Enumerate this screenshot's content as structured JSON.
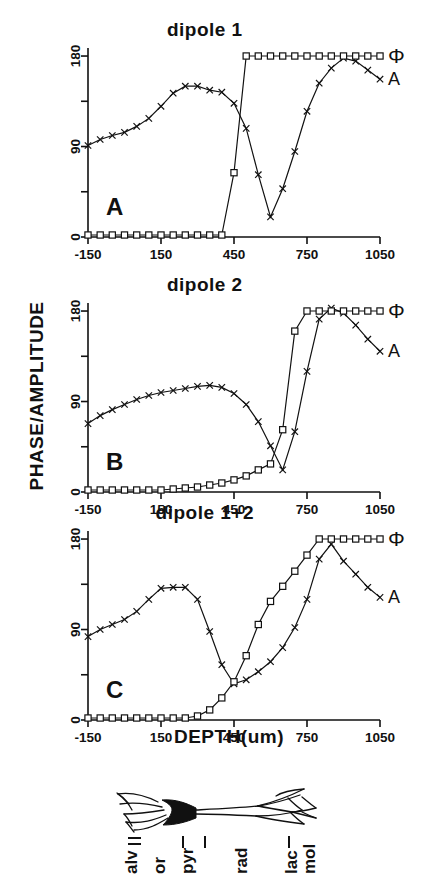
{
  "figure": {
    "y_axis_label": "PHASE/AMPLITUDE",
    "x_axis_label": "DEPTH(um)"
  },
  "axes": {
    "x_ticks": [
      "-150",
      "150",
      "450",
      "750",
      "1050"
    ],
    "x_tick_values": [
      -150,
      150,
      450,
      750,
      1050
    ],
    "y_ticks_labeled": [
      "0",
      "90",
      "180"
    ],
    "y_tick_values_labeled": [
      0,
      90,
      180
    ],
    "y_tick_values_all": [
      0,
      45,
      90,
      135,
      180
    ],
    "xlim": [
      -150,
      1050
    ],
    "ylim": [
      0,
      188
    ]
  },
  "series_labels": {
    "phase": "Φ",
    "amplitude": "A"
  },
  "panels": [
    {
      "letter": "A",
      "title": "dipole 1"
    },
    {
      "letter": "B",
      "title": "dipole 2"
    },
    {
      "letter": "C",
      "title": "dipole 1+2"
    }
  ],
  "morphology": {
    "layers": [
      "alv",
      "or",
      "pyr",
      "rad",
      "lac",
      "mol"
    ]
  },
  "chart_data": [
    {
      "type": "line",
      "panel": "A",
      "title": "dipole 1",
      "xlabel": "DEPTH(um)",
      "ylabel": "PHASE/AMPLITUDE",
      "xlim": [
        -150,
        1050
      ],
      "ylim": [
        0,
        188
      ],
      "grid": false,
      "legend": [
        "Φ",
        "A"
      ],
      "legend_position": "right-of-axes",
      "x": [
        -150,
        -100,
        -50,
        0,
        50,
        100,
        150,
        200,
        250,
        300,
        350,
        400,
        450,
        500,
        550,
        600,
        650,
        700,
        750,
        800,
        850,
        900,
        950,
        1000,
        1050
      ],
      "series": [
        {
          "name": "A",
          "marker": "x",
          "values": [
            91,
            97,
            101,
            104,
            110,
            118,
            130,
            143,
            150,
            150,
            146,
            144,
            133,
            108,
            62,
            20,
            48,
            85,
            125,
            153,
            168,
            178,
            175,
            166,
            157
          ]
        },
        {
          "name": "Φ",
          "marker": "square",
          "values": [
            2,
            2,
            2,
            2,
            2,
            2,
            2,
            2,
            2,
            2,
            2,
            2,
            64,
            180,
            180,
            180,
            180,
            180,
            180,
            180,
            180,
            180,
            180,
            180,
            180
          ]
        }
      ],
      "annotations": [
        "A"
      ]
    },
    {
      "type": "line",
      "panel": "B",
      "title": "dipole 2",
      "xlabel": "DEPTH(um)",
      "ylabel": "PHASE/AMPLITUDE",
      "xlim": [
        -150,
        1050
      ],
      "ylim": [
        0,
        188
      ],
      "grid": false,
      "legend": [
        "Φ",
        "A"
      ],
      "legend_position": "right-of-axes",
      "x": [
        -150,
        -100,
        -50,
        0,
        50,
        100,
        150,
        200,
        250,
        300,
        350,
        400,
        450,
        500,
        550,
        600,
        650,
        700,
        750,
        800,
        850,
        900,
        950,
        1000,
        1050
      ],
      "series": [
        {
          "name": "A",
          "marker": "x",
          "values": [
            68,
            76,
            82,
            87,
            92,
            96,
            99,
            101,
            103,
            105,
            106,
            104,
            98,
            87,
            70,
            46,
            22,
            60,
            120,
            172,
            183,
            178,
            166,
            152,
            140
          ]
        },
        {
          "name": "Φ",
          "marker": "square",
          "values": [
            2,
            2,
            2,
            2,
            2,
            2,
            2,
            3,
            4,
            5,
            7,
            9,
            12,
            16,
            22,
            28,
            62,
            160,
            180,
            180,
            180,
            180,
            180,
            180,
            180
          ]
        }
      ],
      "annotations": [
        "B"
      ]
    },
    {
      "type": "line",
      "panel": "C",
      "title": "dipole 1+2",
      "xlabel": "DEPTH(um)",
      "ylabel": "PHASE/AMPLITUDE",
      "xlim": [
        -150,
        1050
      ],
      "ylim": [
        0,
        188
      ],
      "grid": false,
      "legend": [
        "Φ",
        "A"
      ],
      "legend_position": "right-of-axes",
      "x": [
        -150,
        -100,
        -50,
        0,
        50,
        100,
        150,
        200,
        250,
        300,
        350,
        400,
        450,
        500,
        550,
        600,
        650,
        700,
        750,
        800,
        850,
        900,
        950,
        1000,
        1050
      ],
      "series": [
        {
          "name": "A",
          "marker": "x",
          "values": [
            83,
            90,
            95,
            100,
            108,
            120,
            131,
            132,
            132,
            120,
            88,
            55,
            36,
            40,
            48,
            58,
            72,
            92,
            120,
            160,
            175,
            158,
            145,
            132,
            122
          ]
        },
        {
          "name": "Φ",
          "marker": "square",
          "values": [
            2,
            2,
            2,
            2,
            2,
            2,
            2,
            2,
            2,
            4,
            10,
            22,
            38,
            64,
            95,
            118,
            133,
            148,
            164,
            180,
            180,
            180,
            180,
            180,
            180
          ]
        }
      ],
      "annotations": [
        "C"
      ]
    }
  ]
}
